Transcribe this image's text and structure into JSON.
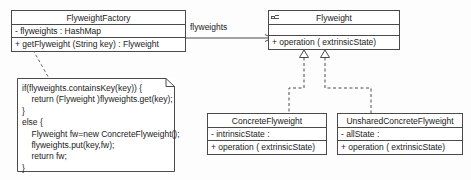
{
  "diagram": {
    "line_color": "#4a4a4a",
    "background": "#fdfdfd",
    "text_color": "#1a1a1a"
  },
  "classes": {
    "factory": {
      "name": "FlyweightFactory",
      "attributes": [
        "- flyweights  :  HashMap"
      ],
      "operations": [
        "+ getFlyweight (String key)  :  Flyweight"
      ]
    },
    "flyweight": {
      "name": "Flyweight",
      "icon": "interface-icon",
      "attributes": [
        ""
      ],
      "operations": [
        "+ operation ( extrinsicState)"
      ]
    },
    "concrete": {
      "name": "ConcreteFlyweight",
      "attributes": [
        "- intrinsicState  :"
      ],
      "operations": [
        "+ operation ( extrinsicState)"
      ]
    },
    "unshared": {
      "name": "UnsharedConcreteFlyweight",
      "attributes": [
        "- allState  :"
      ],
      "operations": [
        "+ operation ( extrinsicState)"
      ]
    }
  },
  "note": {
    "code": "if(flyweights.containsKey(key)) {\n    return (Flyweight )flyweights.get(key);\n}\nelse {\n    Flyweight fw=new ConcreteFlyweight();\n    flyweights.put(key,fw);\n    return fw;\n}"
  },
  "edges": {
    "association_label": "flyweights"
  }
}
